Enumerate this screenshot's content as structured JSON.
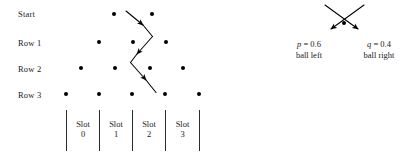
{
  "diagram": {
    "row_labels": [
      {
        "text": "Start",
        "x": 18,
        "y": 9
      },
      {
        "text": "Row 1",
        "x": 18,
        "y": 38
      },
      {
        "text": "Row 2",
        "x": 18,
        "y": 64
      },
      {
        "text": "Row 3",
        "x": 18,
        "y": 90
      }
    ],
    "peg_rows": [
      {
        "name": "start",
        "y": 14,
        "xs": [
          114,
          152
        ]
      },
      {
        "name": "row-1",
        "y": 42,
        "xs": [
          99,
          133,
          166
        ]
      },
      {
        "name": "row-2",
        "y": 68,
        "xs": [
          81,
          115,
          150,
          183
        ]
      },
      {
        "name": "row-3",
        "y": 94,
        "xs": [
          66,
          99,
          132,
          165,
          199
        ]
      }
    ],
    "ball_path": {
      "stroke": "#000000",
      "segments": [
        {
          "x1": 126,
          "y1": 11,
          "x2": 143,
          "y2": 25,
          "arrow": true
        },
        {
          "x1": 143,
          "y1": 25,
          "x2": 152,
          "y2": 36,
          "arrow": false
        },
        {
          "x1": 152,
          "y1": 36,
          "x2": 137,
          "y2": 54,
          "arrow": true
        },
        {
          "x1": 137,
          "y1": 54,
          "x2": 131,
          "y2": 62,
          "arrow": false
        },
        {
          "x1": 131,
          "y1": 62,
          "x2": 146,
          "y2": 80,
          "arrow": true
        },
        {
          "x1": 146,
          "y1": 80,
          "x2": 156,
          "y2": 92,
          "arrow": false
        }
      ]
    },
    "slots": {
      "dividers": {
        "y_top": 110,
        "y_bottom": 151,
        "xs": [
          66,
          99,
          132,
          165,
          199
        ]
      },
      "items": [
        {
          "label_top": "Slot",
          "label_bottom": "0",
          "x": 82,
          "y": 120
        },
        {
          "label_top": "Slot",
          "label_bottom": "1",
          "x": 115,
          "y": 120
        },
        {
          "label_top": "Slot",
          "label_bottom": "2",
          "x": 148,
          "y": 120
        },
        {
          "label_top": "Slot",
          "label_bottom": "3",
          "x": 182,
          "y": 120
        }
      ]
    },
    "legend": {
      "peg": {
        "x": 344,
        "y": 23
      },
      "arrows": [
        {
          "name": "left-branch-arrow",
          "x1": 364,
          "y1": 5,
          "x2": 329,
          "y2": 31
        },
        {
          "name": "right-branch-arrow",
          "x1": 325,
          "y1": 5,
          "x2": 360,
          "y2": 31
        }
      ],
      "entries": [
        {
          "name": "left",
          "symbol": "p",
          "equals": " = 0.6",
          "caption": "ball left",
          "x": 308,
          "y": 40
        },
        {
          "name": "right",
          "symbol": "q",
          "equals": " = 0.4",
          "caption": "ball right",
          "x": 379,
          "y": 40
        }
      ]
    },
    "colors": {
      "ink": "#000000",
      "text": "#1a1a1a",
      "rule": "#2b2b2b",
      "background": "#ffffff"
    }
  }
}
